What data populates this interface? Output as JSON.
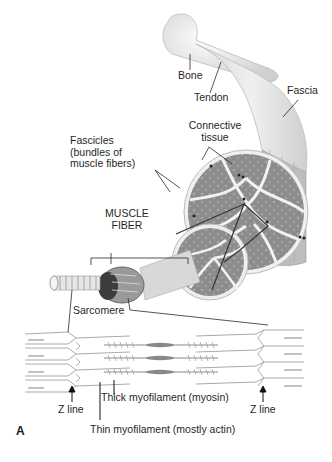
{
  "figure": {
    "panel_letter": "A",
    "labels": {
      "bone": "Bone",
      "tendon": "Tendon",
      "fascia": "Fascia",
      "connective_tissue_1": "Connective",
      "connective_tissue_2": "tissue",
      "fascicles_1": "Fascicles",
      "fascicles_2": "(bundles of",
      "fascicles_3": "muscle fibers)",
      "muscle_fiber_1": "MUSCLE",
      "muscle_fiber_2": "FIBER",
      "sarcomere": "Sarcomere",
      "z_line_left": "Z line",
      "z_line_right": "Z line",
      "thick_myofilament": "Thick myofilament (myosin)",
      "thin_myofilament": "Thin myofilament (mostly actin)"
    },
    "colors": {
      "line": "#2a2a2a",
      "bone": "#ececec",
      "fascicle": "#8a8a8a",
      "connective": "#f2f2f2",
      "filament": "#9a9a9a"
    }
  }
}
